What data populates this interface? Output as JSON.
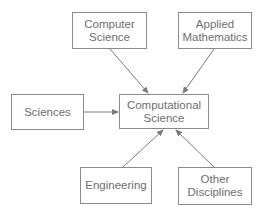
{
  "diagram": {
    "type": "concept-map",
    "colors": {
      "border": "#8a8a8a",
      "text": "#6e6e6e",
      "arrow": "#7a7a7a",
      "background": "#ffffff"
    },
    "nodes": {
      "computer_science": {
        "line1": "Computer",
        "line2": "Science"
      },
      "applied_mathematics": {
        "line1": "Applied",
        "line2": "Mathematics"
      },
      "sciences": {
        "line1": "Sciences"
      },
      "computational_science": {
        "line1": "Computational",
        "line2": "Science"
      },
      "engineering": {
        "line1": "Engineering"
      },
      "other_disciplines": {
        "line1": "Other",
        "line2": "Disciplines"
      }
    },
    "edges": [
      {
        "from": "Computer Science",
        "to": "Computational Science"
      },
      {
        "from": "Applied Mathematics",
        "to": "Computational Science"
      },
      {
        "from": "Sciences",
        "to": "Computational Science"
      },
      {
        "from": "Engineering",
        "to": "Computational Science"
      },
      {
        "from": "Other Disciplines",
        "to": "Computational Science"
      }
    ]
  }
}
